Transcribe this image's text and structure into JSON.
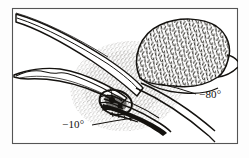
{
  "figure": {
    "kind": "line-art-diagram",
    "medium": "scanned pen-and-ink illustration",
    "background_color": "#fdfdfd",
    "ink_color": "#14120f",
    "frame": {
      "name": "figure-border",
      "stroke_color": "#555555",
      "x": 12,
      "y": 8,
      "width": 226,
      "height": 136
    }
  },
  "annotations": [
    {
      "id": "angle-10",
      "label": "−10°",
      "leader_from": [
        96,
        125
      ],
      "leader_to": [
        133,
        119
      ],
      "position": {
        "x": 62,
        "y": 119
      }
    },
    {
      "id": "angle-80",
      "label": "−80°",
      "leader_from": [
        196,
        94
      ],
      "leader_to": [
        160,
        85
      ],
      "position": {
        "x": 199,
        "y": 89
      }
    }
  ],
  "regions": [
    {
      "id": "hatched-blob",
      "name": "hatched-tissue-mass",
      "fill_pattern": "short-dash-hatch",
      "outline": true,
      "description": "rounded blob in upper right filled with short irregular dashes"
    },
    {
      "id": "stipple-cloud",
      "name": "stippled-soft-tissue",
      "fill_pattern": "fine-stipple-dots",
      "outline": false,
      "description": "diffuse dotted cloud centred on the middle of the figure"
    },
    {
      "id": "upper-band",
      "name": "upper-curved-band",
      "fill_pattern": "outline",
      "description": "long tapering double-line band sweeping from upper-left to the centre"
    },
    {
      "id": "lower-blade",
      "name": "lower-wedge-blade",
      "fill_pattern": "outline",
      "description": "narrow wavy wedge entering from the left edge toward the centre"
    },
    {
      "id": "dark-tail",
      "name": "dark-tapering-tail",
      "fill_pattern": "solid",
      "description": "solid dark tapering stroke curving down and right from the centre"
    },
    {
      "id": "right-strut",
      "name": "right-double-strut",
      "fill_pattern": "outline",
      "description": "pair of parallel lines running from the centre to the lower-right corner"
    },
    {
      "id": "core-knot",
      "name": "central-dark-knot",
      "fill_pattern": "solid-dense",
      "description": "small dense tangle of dark strokes at the convergence point"
    }
  ]
}
